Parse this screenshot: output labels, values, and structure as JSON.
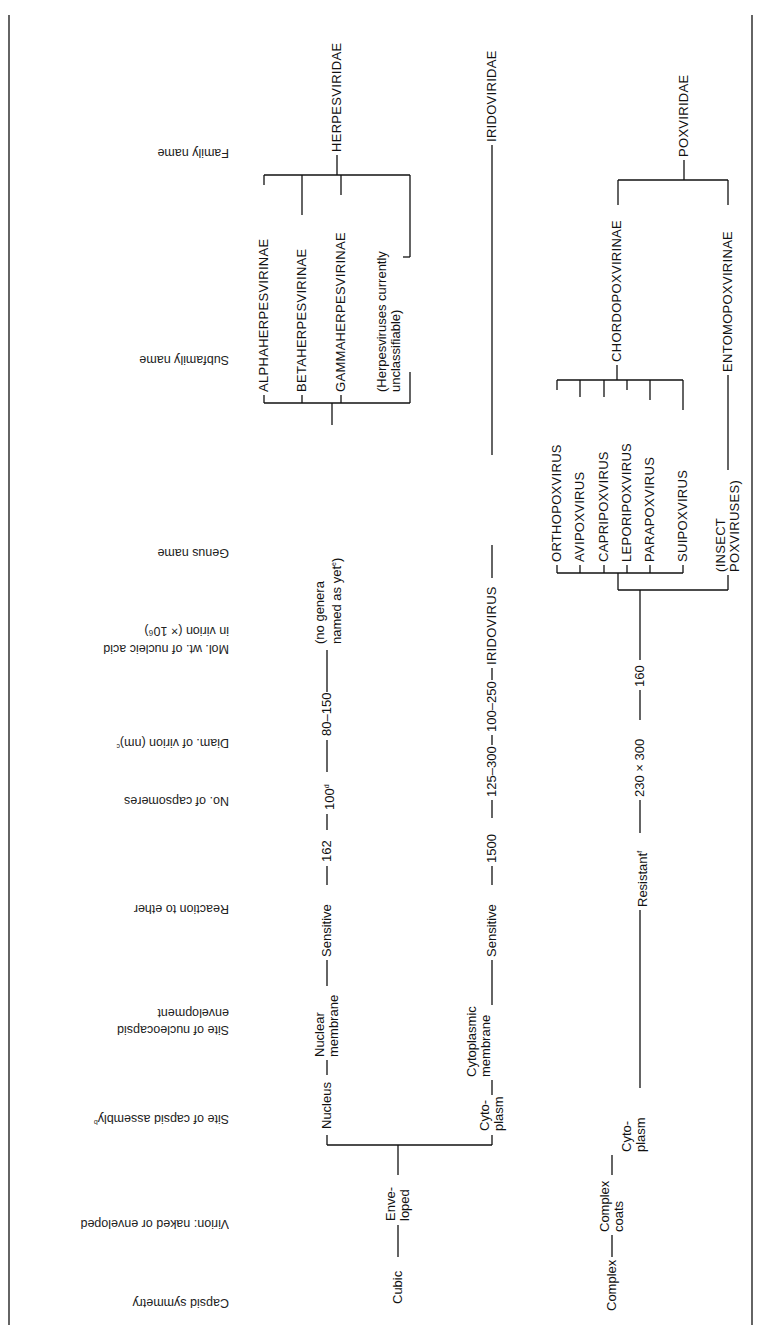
{
  "table": {
    "headers": [
      {
        "key": "capsid_symmetry",
        "label": "Capsid symmetry"
      },
      {
        "key": "virion",
        "label": "Virion: naked or enveloped"
      },
      {
        "key": "site_assembly",
        "label": "Site of capsid assembly",
        "footnote": "b"
      },
      {
        "key": "site_envelopment_l1",
        "label": "Site of nucleocapsid"
      },
      {
        "key": "site_envelopment_l2",
        "label": "envelopment"
      },
      {
        "key": "ether",
        "label": "Reaction to ether"
      },
      {
        "key": "capsomeres",
        "label": "No. of capsomeres"
      },
      {
        "key": "diameter",
        "label": "Diam. of virion (nm)",
        "footnote": "c"
      },
      {
        "key": "molwt_l1",
        "label": "Mol. wt. of nucleic acid"
      },
      {
        "key": "molwt_l2",
        "label": "in virion (× 10⁶)"
      },
      {
        "key": "genus",
        "label": "Genus name"
      },
      {
        "key": "subfamily",
        "label": "Subfamily name"
      },
      {
        "key": "family",
        "label": "Family name"
      }
    ],
    "root_cubic": {
      "symmetry": "Cubic",
      "virion_l1": "Enve-",
      "virion_l2": "loped"
    },
    "herpes": {
      "assembly": "Nucleus",
      "envelopment_l1": "Nuclear",
      "envelopment_l2": "membrane",
      "ether": "Sensitive",
      "capsomeres": "162",
      "diameter": "100",
      "diameter_footnote": "d",
      "molwt": "80–150",
      "genus_l1": "(no genera",
      "genus_l2": "named as yet",
      "genus_footnote": "e",
      "genus_close": ")",
      "subfamilies": [
        "ALPHAHERPESVIRINAE",
        "BETAHERPESVIRINAE",
        "GAMMAHERPESVIRINAE"
      ],
      "unclassifiable_l1": "(Herpesviruses currently",
      "unclassifiable_l2": "unclassifiable)",
      "family": "HERPESVIRIDAE"
    },
    "irido": {
      "assembly_l1": "Cyto-",
      "assembly_l2": "plasm",
      "envelopment_l1": "Cytoplasmic",
      "envelopment_l2": "membrane",
      "ether": "Sensitive",
      "capsomeres": "1500",
      "diameter": "125–300",
      "molwt": "100–250",
      "genus": "IRIDOVIRUS",
      "family": "IRIDOVIRIDAE"
    },
    "pox": {
      "symmetry": "Complex",
      "virion_l1": "Complex",
      "virion_l2": "coats",
      "assembly_l1": "Cyto-",
      "assembly_l2": "plasm",
      "ether": "Resistant",
      "ether_footnote": "f",
      "diameter": "230 × 300",
      "molwt": "160",
      "chordo_genera": [
        "ORTHOPOXVIRUS",
        "AVIPOXVIRUS",
        "CAPRIPOXVIRUS",
        "LEPORIPOXVIRUS",
        "PARAPOXVIRUS",
        "SUIPOXVIRUS"
      ],
      "insect_l1": "(INSECT",
      "insect_l2": "POXVIRUSES)",
      "subfamilies": [
        "CHORDOPOXVIRINAE",
        "ENTOMOPOXVIRINAE"
      ],
      "family": "POXVIRIDAE"
    }
  }
}
